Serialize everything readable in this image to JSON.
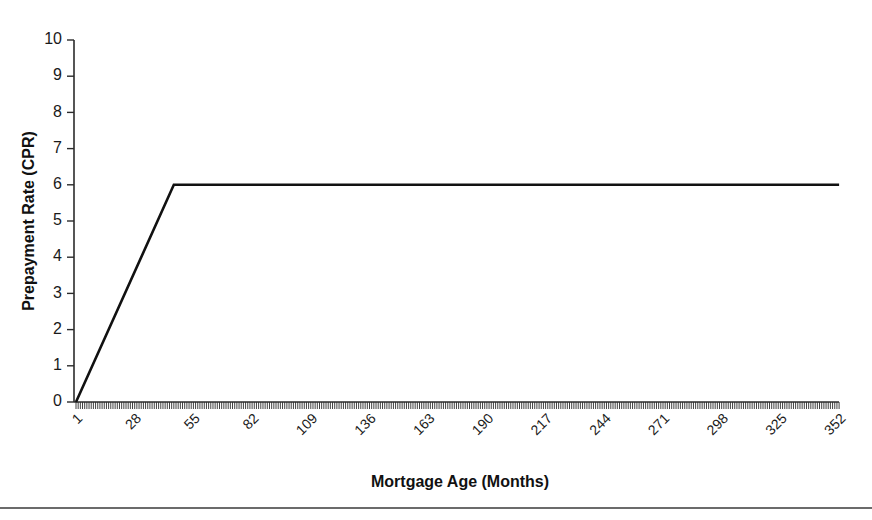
{
  "figure": {
    "background_color": "#ffffff",
    "line_color": "#111111",
    "axis_color": "#2b2b2b"
  },
  "axis_titles": {
    "y": "Prepayment Rate (CPR)",
    "x": "Mortgage Age (Months)"
  },
  "y_ticks": [
    "0",
    "1",
    "2",
    "3",
    "4",
    "5",
    "6",
    "7",
    "8",
    "9",
    "10"
  ],
  "x_ticks": [
    "1",
    "28",
    "55",
    "82",
    "109",
    "136",
    "163",
    "190",
    "217",
    "244",
    "271",
    "298",
    "325",
    "352"
  ],
  "chart_data": {
    "type": "line",
    "title": "",
    "subtitle": "",
    "xlabel": "Mortgage Age (Months)",
    "ylabel": "Prepayment Rate (CPR)",
    "xlim": [
      1,
      360
    ],
    "ylim": [
      0,
      10
    ],
    "grid": false,
    "legend": false,
    "legend_position": "none",
    "x_tick_values": [
      1,
      28,
      55,
      82,
      109,
      136,
      163,
      190,
      217,
      244,
      271,
      298,
      325,
      352
    ],
    "x_tick_labels": [
      "1",
      "28",
      "55",
      "82",
      "109",
      "136",
      "163",
      "190",
      "217",
      "244",
      "271",
      "298",
      "325",
      "352"
    ],
    "x_tick_label_rotation": 45,
    "x_minor_tick_interval": 1,
    "y_tick_values": [
      0,
      1,
      2,
      3,
      4,
      5,
      6,
      7,
      8,
      9,
      10
    ],
    "y_tick_labels": [
      "0",
      "1",
      "2",
      "3",
      "4",
      "5",
      "6",
      "7",
      "8",
      "9",
      "10"
    ],
    "annotations": [],
    "series": [
      {
        "name": "Prepayment Rate (CPR)",
        "color": "#111111",
        "line_width": 2.6,
        "description": "Linear ramp from 0 CPR at month 1 to 6 CPR at month 46, constant 6 CPR thereafter to month 360",
        "x": [
          1,
          46,
          360
        ],
        "values": [
          0,
          6,
          6
        ]
      }
    ],
    "ramp": {
      "start_month": 1,
      "start_cpr": 0,
      "plateau_month": 46,
      "plateau_cpr": 6,
      "end_month": 360,
      "end_cpr": 6
    }
  }
}
